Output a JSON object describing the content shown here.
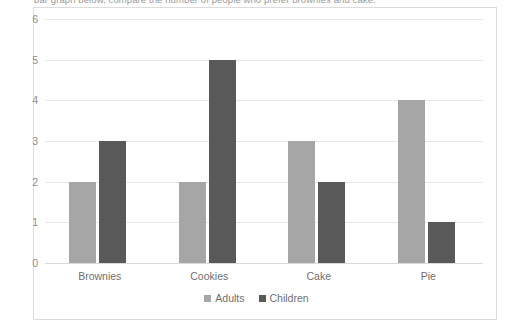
{
  "clipped_caption": "bar graph below, compare the number of people who prefer brownies and cake.",
  "chart_data": {
    "type": "bar",
    "title": "",
    "xlabel": "",
    "ylabel": "",
    "categories": [
      "Brownies",
      "Cookies",
      "Cake",
      "Pie"
    ],
    "series": [
      {
        "name": "Adults",
        "values": [
          2,
          2,
          3,
          4
        ],
        "color": "#a6a6a6"
      },
      {
        "name": "Children",
        "values": [
          3,
          5,
          2,
          1
        ],
        "color": "#595959"
      }
    ],
    "ylim": [
      0,
      6
    ],
    "yticks": [
      0,
      1,
      2,
      3,
      4,
      5,
      6
    ],
    "ytick_labels": [
      "0",
      "1",
      "2",
      "3",
      "4",
      "5",
      "6"
    ],
    "grid": "horizontal",
    "legend_position": "bottom"
  },
  "colors": {
    "adults": "#a6a6a6",
    "children": "#595959",
    "gridline": "#e8e8e8",
    "axis": "#d9d9d9",
    "frame_border": "#dcdcdc",
    "label_text": "#6f6f6f",
    "tick_text": "#8d8d8d"
  }
}
